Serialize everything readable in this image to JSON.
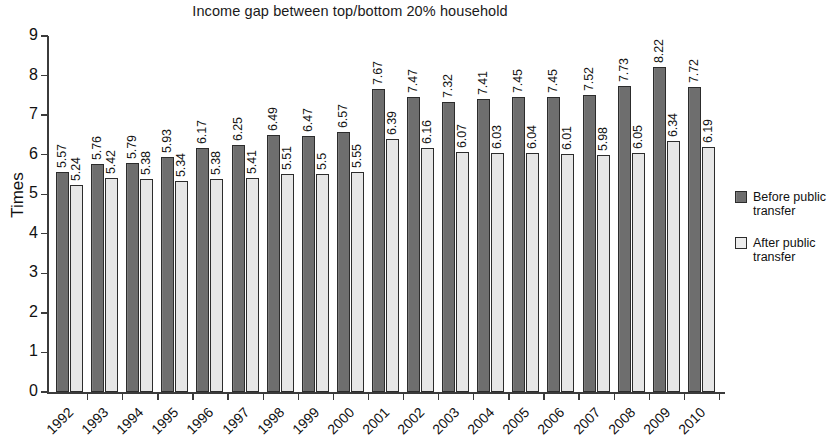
{
  "chart_data": {
    "type": "bar",
    "title": "Income gap between top/bottom 20% household",
    "xlabel": "",
    "ylabel": "Times",
    "ylim": [
      0,
      9
    ],
    "y_ticks": [
      0,
      1,
      2,
      3,
      4,
      5,
      6,
      7,
      8,
      9
    ],
    "grid": false,
    "legend_position": "right",
    "categories": [
      "1992",
      "1993",
      "1994",
      "1995",
      "1996",
      "1997",
      "1998",
      "1999",
      "2000",
      "2001",
      "2002",
      "2003",
      "2004",
      "2005",
      "2006",
      "2007",
      "2008",
      "2009",
      "2010"
    ],
    "series": [
      {
        "name": "Before public transfer",
        "color": "#6e6e6e",
        "values": [
          5.57,
          5.76,
          5.79,
          5.93,
          6.17,
          6.25,
          6.49,
          6.47,
          6.57,
          7.67,
          7.47,
          7.32,
          7.41,
          7.45,
          7.45,
          7.52,
          7.73,
          8.22,
          7.72
        ]
      },
      {
        "name": "After public transfer",
        "color": "#e6e6e6",
        "values": [
          5.24,
          5.42,
          5.38,
          5.34,
          5.38,
          5.41,
          5.51,
          5.5,
          5.55,
          6.39,
          6.16,
          6.07,
          6.03,
          6.04,
          6.01,
          5.98,
          6.05,
          6.34,
          6.19
        ]
      }
    ],
    "data_labels": {
      "before": [
        "5.57",
        "5.76",
        "5.79",
        "5.93",
        "6.17",
        "6.25",
        "6.49",
        "6.47",
        "6.57",
        "7.67",
        "7.47",
        "7.32",
        "7.41",
        "7.45",
        "7.45",
        "7.52",
        "7.73",
        "8.22",
        "7.72"
      ],
      "after": [
        "5.24",
        "5.42",
        "5.38",
        "5.34",
        "5.38",
        "5.41",
        "5.51",
        "5.5",
        "5.55",
        "6.39",
        "6.16",
        "6.07",
        "6.03",
        "6.04",
        "6.01",
        "5.98",
        "6.05",
        "6.34",
        "6.19"
      ]
    }
  },
  "legend": {
    "items": [
      {
        "label": "Before public transfer",
        "swatch": "before"
      },
      {
        "label": "After public transfer",
        "swatch": "after"
      }
    ]
  }
}
